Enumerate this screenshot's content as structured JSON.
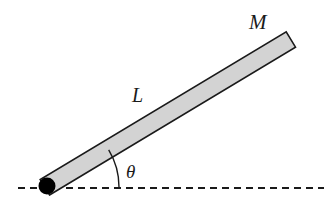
{
  "figure": {
    "background_color": "#ffffff",
    "width": 331,
    "height": 206,
    "labels": {
      "mass": "M",
      "length": "L",
      "angle": "θ"
    },
    "colors": {
      "rod_fill": "#d3d3d3",
      "rod_outline": "#1a1a1a",
      "pivot": "#000000",
      "ground_line": "#1a1a1a",
      "angle_arc": "#1a1a1a",
      "label_text": "#1a1a1a"
    },
    "elements": {
      "rod": {
        "name": "rod",
        "pivot_x": 47,
        "pivot_y": 186,
        "tip_x": 290,
        "tip_y": 40,
        "thickness": 18,
        "angle_degrees": 31
      },
      "pivot": {
        "name": "pivot-point",
        "cx": 47,
        "cy": 186,
        "r": 8.5
      },
      "ground_line": {
        "name": "ground-dashed-line",
        "x1": 18,
        "x2": 324,
        "y": 188,
        "dash": "7 5",
        "stroke_width": 2
      },
      "angle_arc": {
        "name": "angle-arc",
        "center_x": 47,
        "center_y": 187,
        "radius": 72,
        "start_degrees": 0,
        "end_degrees": 31
      }
    },
    "label_positions": {
      "mass": {
        "x": 249,
        "y": 29
      },
      "length": {
        "x": 132,
        "y": 102
      },
      "angle": {
        "x": 126,
        "y": 178
      }
    }
  }
}
